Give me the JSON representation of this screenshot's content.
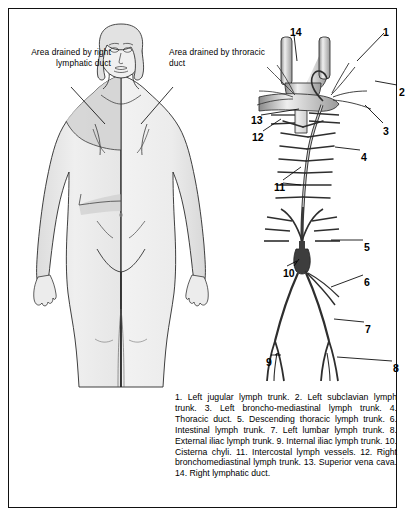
{
  "figure": {
    "callouts": [
      {
        "name": "area-right-lymphatic-duct",
        "text": "Area drained by right lymphatic duct"
      },
      {
        "name": "area-thoracic-duct",
        "text": "Area drained by throracic duct"
      }
    ],
    "markers": [
      {
        "id": "1",
        "x": 374,
        "y": 17
      },
      {
        "id": "2",
        "x": 390,
        "y": 77
      },
      {
        "id": "3",
        "x": 374,
        "y": 116
      },
      {
        "id": "4",
        "x": 352,
        "y": 142
      },
      {
        "id": "5",
        "x": 355,
        "y": 232
      },
      {
        "id": "6",
        "x": 355,
        "y": 267
      },
      {
        "id": "7",
        "x": 356,
        "y": 314
      },
      {
        "id": "8",
        "x": 384,
        "y": 353
      },
      {
        "id": "9",
        "x": 257,
        "y": 347
      },
      {
        "id": "10",
        "x": 274,
        "y": 258
      },
      {
        "id": "11",
        "x": 265,
        "y": 172
      },
      {
        "id": "12",
        "x": 243,
        "y": 122
      },
      {
        "id": "13",
        "x": 242,
        "y": 105
      },
      {
        "id": "14",
        "x": 281,
        "y": 17
      }
    ],
    "caption": "1. Left jugular lymph trunk. 2. Left subclavian lymph trunk. 3. Left broncho-mediastinal lymph trunk. 4. Thoracic duct. 5. Descending thoracic lymph trunk. 6. Intestinal lymph trunk. 7. Left lumbar lymph trunk. 8. External iliac lymph trunk. 9. Internal iliac lymph trunk. 10. Cisterna chyli. 11. Intercostal lymph vessels. 12. Right bronchomediastinal lymph trunk. 13. Superior vena cava. 14. Right lymphatic duct.",
    "colors": {
      "border": "#111111",
      "ink": "#000000",
      "body_shade_light": "#f1f1f1",
      "body_shade_mid": "#e3e3e3",
      "body_shade_dark": "#cfcfcf",
      "vessel_fill": "#b9b9b9",
      "background": "#ffffff"
    }
  }
}
